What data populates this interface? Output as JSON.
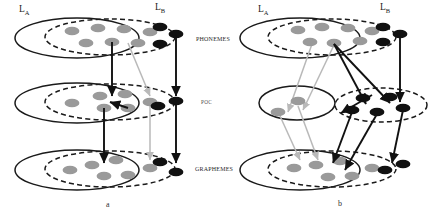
{
  "figure": {
    "panels": [
      {
        "id": "a",
        "caption": "a"
      },
      {
        "id": "b",
        "caption": "b"
      }
    ],
    "layer_labels": {
      "phonemes": "phonemes",
      "poc": "POC",
      "graphemes": "graphemes"
    },
    "language_labels": {
      "a_left": "L",
      "a_left_sub": "A",
      "a_right": "L",
      "a_right_sub": "B",
      "b_left": "L",
      "b_left_sub": "A",
      "b_right": "L",
      "b_right_sub": "B"
    },
    "colors": {
      "node_shared": "#9a9a9a",
      "node_exclusive": "#111111",
      "outline_solid": "#1a1a1a",
      "outline_dashed": "#1a1a1a",
      "arrow_strong": "#111111",
      "arrow_weak": "#b9b9b9",
      "background": "#ffffff"
    },
    "legend_semantics": {
      "solid_ellipse": "language-A representational space",
      "dashed_ellipse": "language-B representational space",
      "gray_node": "shared / language-A unit",
      "black_node": "language-B exclusive unit",
      "black_arrow": "strong mapping connection",
      "gray_arrow": "weak mapping connection"
    }
  },
  "panel_a": {
    "layers": [
      {
        "name": "phonemes",
        "solid_ellipse": {
          "cx": 77,
          "cy": 38,
          "rx": 62,
          "ry": 20
        },
        "dashed_ellipse": {
          "cx": 110,
          "cy": 37,
          "rx": 65,
          "ry": 18
        },
        "gray_nodes": [
          {
            "cx": 72,
            "cy": 31
          },
          {
            "cx": 98,
            "cy": 28
          },
          {
            "cx": 124,
            "cy": 29
          },
          {
            "cx": 150,
            "cy": 32
          },
          {
            "cx": 86,
            "cy": 43
          },
          {
            "cx": 112,
            "cy": 42
          },
          {
            "cx": 138,
            "cy": 43
          }
        ],
        "black_nodes": [
          {
            "cx": 160,
            "cy": 27
          },
          {
            "cx": 176,
            "cy": 34
          },
          {
            "cx": 160,
            "cy": 44
          }
        ]
      },
      {
        "name": "poc",
        "solid_ellipse": {
          "cx": 77,
          "cy": 103,
          "rx": 62,
          "ry": 20
        },
        "dashed_ellipse": {
          "cx": 110,
          "cy": 102,
          "rx": 65,
          "ry": 18
        },
        "gray_nodes": [
          {
            "cx": 72,
            "cy": 103
          },
          {
            "cx": 100,
            "cy": 96
          },
          {
            "cx": 125,
            "cy": 94
          },
          {
            "cx": 104,
            "cy": 108
          },
          {
            "cx": 128,
            "cy": 108
          },
          {
            "cx": 150,
            "cy": 102
          }
        ],
        "black_nodes": [
          {
            "cx": 158,
            "cy": 106
          },
          {
            "cx": 176,
            "cy": 101
          }
        ]
      },
      {
        "name": "graphemes",
        "solid_ellipse": {
          "cx": 77,
          "cy": 170,
          "rx": 62,
          "ry": 20
        },
        "dashed_ellipse": {
          "cx": 110,
          "cy": 169,
          "rx": 65,
          "ry": 18
        },
        "gray_nodes": [
          {
            "cx": 70,
            "cy": 170
          },
          {
            "cx": 92,
            "cy": 165
          },
          {
            "cx": 116,
            "cy": 160
          },
          {
            "cx": 104,
            "cy": 176
          },
          {
            "cx": 128,
            "cy": 175
          },
          {
            "cx": 150,
            "cy": 168
          }
        ],
        "black_nodes": [
          {
            "cx": 160,
            "cy": 162
          },
          {
            "cx": 176,
            "cy": 172
          }
        ]
      }
    ],
    "arrows_strong": [
      {
        "x1": 112,
        "y1": 42,
        "x2": 112,
        "y2": 96
      },
      {
        "x1": 176,
        "y1": 34,
        "x2": 176,
        "y2": 96
      },
      {
        "x1": 104,
        "y1": 108,
        "x2": 104,
        "y2": 163
      },
      {
        "x1": 176,
        "y1": 103,
        "x2": 176,
        "y2": 163
      },
      {
        "x1": 128,
        "y1": 108,
        "x2": 110,
        "y2": 102
      }
    ],
    "arrows_weak": [
      {
        "x1": 128,
        "y1": 43,
        "x2": 150,
        "y2": 96
      },
      {
        "x1": 150,
        "y1": 104,
        "x2": 150,
        "y2": 160
      }
    ]
  },
  "panel_b": {
    "layers": [
      {
        "name": "phonemes",
        "solid_ellipse": {
          "cx": 300,
          "cy": 38,
          "rx": 60,
          "ry": 20
        },
        "dashed_ellipse": {
          "cx": 332,
          "cy": 37,
          "rx": 64,
          "ry": 18
        },
        "gray_nodes": [
          {
            "cx": 298,
            "cy": 30
          },
          {
            "cx": 322,
            "cy": 27
          },
          {
            "cx": 348,
            "cy": 28
          },
          {
            "cx": 372,
            "cy": 31
          },
          {
            "cx": 310,
            "cy": 42
          },
          {
            "cx": 334,
            "cy": 43
          },
          {
            "cx": 360,
            "cy": 41
          }
        ],
        "black_nodes": [
          {
            "cx": 383,
            "cy": 27
          },
          {
            "cx": 400,
            "cy": 34
          },
          {
            "cx": 383,
            "cy": 42
          }
        ]
      },
      {
        "name": "poc_left",
        "solid_ellipse": {
          "cx": 297,
          "cy": 103,
          "rx": 38,
          "ry": 17
        },
        "gray_nodes": [
          {
            "cx": 298,
            "cy": 101
          },
          {
            "cx": 278,
            "cy": 112
          }
        ]
      },
      {
        "name": "poc_right",
        "dashed_ellipse": {
          "cx": 381,
          "cy": 105,
          "rx": 46,
          "ry": 17
        },
        "black_nodes": [
          {
            "cx": 363,
            "cy": 98
          },
          {
            "cx": 390,
            "cy": 97
          },
          {
            "cx": 352,
            "cy": 110
          },
          {
            "cx": 377,
            "cy": 112
          },
          {
            "cx": 403,
            "cy": 108
          }
        ]
      },
      {
        "name": "graphemes",
        "solid_ellipse": {
          "cx": 300,
          "cy": 170,
          "rx": 60,
          "ry": 20
        },
        "dashed_ellipse": {
          "cx": 332,
          "cy": 169,
          "rx": 64,
          "ry": 18
        },
        "gray_nodes": [
          {
            "cx": 294,
            "cy": 168
          },
          {
            "cx": 316,
            "cy": 165
          },
          {
            "cx": 340,
            "cy": 161
          },
          {
            "cx": 328,
            "cy": 177
          },
          {
            "cx": 352,
            "cy": 176
          },
          {
            "cx": 372,
            "cy": 168
          }
        ],
        "black_nodes": [
          {
            "cx": 385,
            "cy": 170
          },
          {
            "cx": 403,
            "cy": 164
          }
        ]
      }
    ],
    "arrows_strong": [
      {
        "x1": 334,
        "y1": 44,
        "x2": 366,
        "y2": 104
      },
      {
        "x1": 334,
        "y1": 44,
        "x2": 390,
        "y2": 103
      },
      {
        "x1": 400,
        "y1": 36,
        "x2": 400,
        "y2": 102
      },
      {
        "x1": 372,
        "y1": 95,
        "x2": 341,
        "y2": 113
      },
      {
        "x1": 352,
        "y1": 112,
        "x2": 333,
        "y2": 163
      },
      {
        "x1": 377,
        "y1": 114,
        "x2": 345,
        "y2": 170
      },
      {
        "x1": 403,
        "y1": 110,
        "x2": 392,
        "y2": 163
      }
    ],
    "arrows_weak": [
      {
        "x1": 312,
        "y1": 44,
        "x2": 288,
        "y2": 112
      },
      {
        "x1": 334,
        "y1": 45,
        "x2": 303,
        "y2": 110
      },
      {
        "x1": 298,
        "y1": 106,
        "x2": 318,
        "y2": 160
      },
      {
        "x1": 280,
        "y1": 116,
        "x2": 300,
        "y2": 160
      }
    ]
  }
}
